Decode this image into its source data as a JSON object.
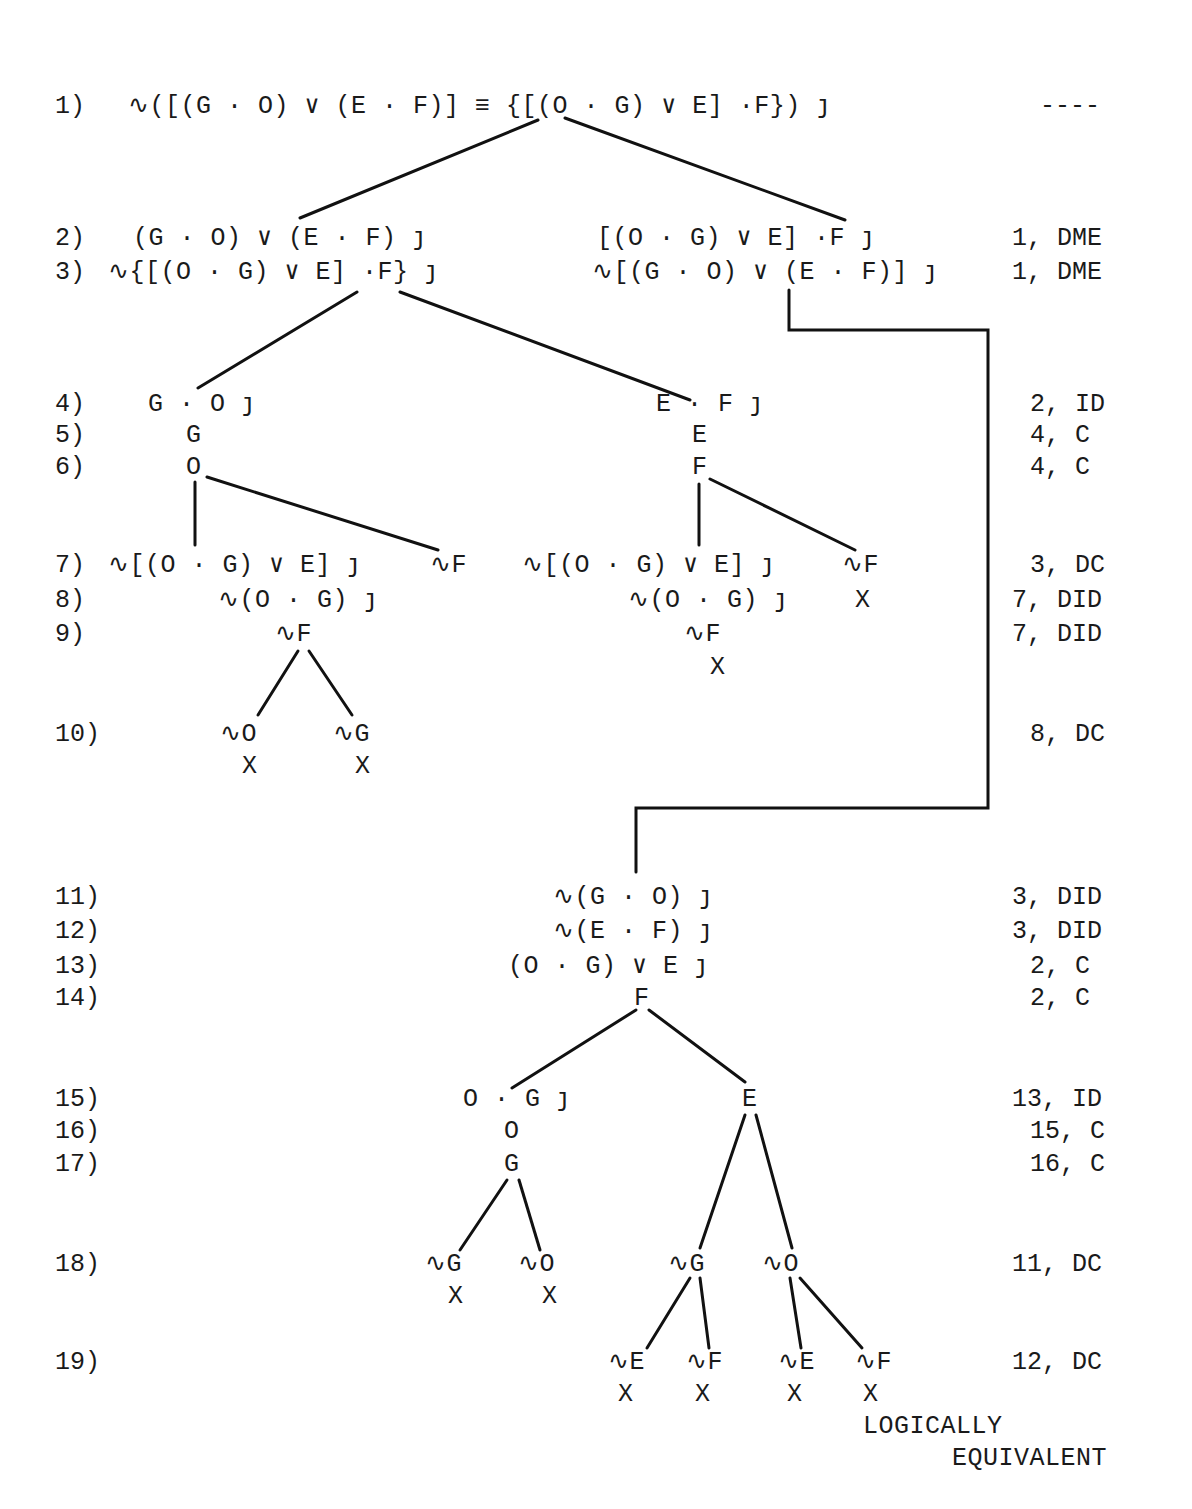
{
  "line_numbers": [
    "1)",
    "2)",
    "3)",
    "4)",
    "5)",
    "6)",
    "7)",
    "8)",
    "9)",
    "10)",
    "11)",
    "12)",
    "13)",
    "14)",
    "15)",
    "16)",
    "17)",
    "18)",
    "19)"
  ],
  "justifications": {
    "j1": "----",
    "j2": "1, DME",
    "j3": "1, DME",
    "j4": "2, ID",
    "j5": "4, C",
    "j6": "4, C",
    "j7": "3, DC",
    "j8": "7, DID",
    "j9": "7, DID",
    "j10": "8, DC",
    "j11": "3, DID",
    "j12": "3, DID",
    "j13": "2, C",
    "j14": "2, C",
    "j15": "13, ID",
    "j16": "15, C",
    "j17": "16, C",
    "j18": "11, DC",
    "j19": "12, DC"
  },
  "nodes": {
    "n1": "∿([(G · O) ∨ (E · F)] ≡ {[(O · G) ∨ E] ·F}) ȷ",
    "n2L": "(G · O) ∨ (E · F) ȷ",
    "n3L": "∿{[(O · G) ∨ E] ·F} ȷ",
    "n2R": "[(O · G) ∨ E] ·F ȷ",
    "n3R": "∿[(G · O) ∨ (E · F)] ȷ",
    "n4L": "G · O ȷ",
    "n5L": "G",
    "n6L": "O",
    "n4R": "E · F ȷ",
    "n5R": "E",
    "n6R": "F",
    "n7LL": "∿[(O · G) ∨ E] ȷ",
    "n7LR": "∿F",
    "n8LL": "∿(O · G) ȷ",
    "n9LL": "∿F",
    "n10a": "∿O",
    "n10a_x": "X",
    "n10b": "∿G",
    "n10b_x": "X",
    "n7RL": "∿[(O · G) ∨ E] ȷ",
    "n7RR": "∿F",
    "n8RR_x": "X",
    "n8RL": "∿(O · G) ȷ",
    "n9RL": "∿F",
    "n9RL_x": "X",
    "n11": "∿(G · O) ȷ",
    "n12": "∿(E · F) ȷ",
    "n13": "(O · G) ∨ E ȷ",
    "n14": "F",
    "n15L": "O · G ȷ",
    "n16L": "O",
    "n17L": "G",
    "n15R": "E",
    "n18a": "∿G",
    "n18a_x": "X",
    "n18b": "∿O",
    "n18b_x": "X",
    "n18c": "∿G",
    "n18d": "∿O",
    "n19a": "∿E",
    "n19a_x": "X",
    "n19b": "∿F",
    "n19b_x": "X",
    "n19c": "∿E",
    "n19c_x": "X",
    "n19d": "∿F",
    "n19d_x": "X"
  },
  "conclusion": {
    "line1": "LOGICALLY",
    "line2": "EQUIVALENT"
  }
}
